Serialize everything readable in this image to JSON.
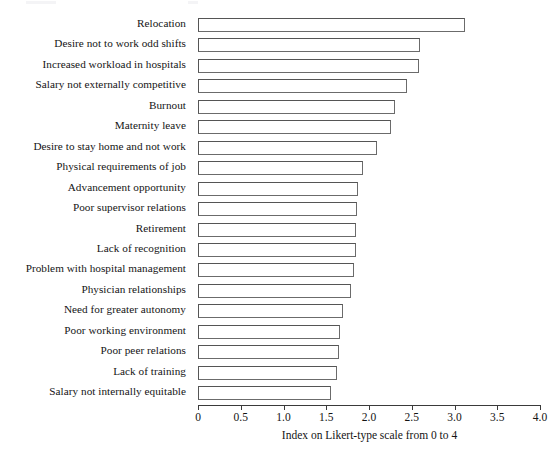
{
  "chart_data": {
    "type": "bar",
    "orientation": "horizontal",
    "title": "",
    "xlabel": "Index on Likert-type scale from 0 to 4",
    "ylabel": "",
    "xlim": [
      0,
      4
    ],
    "grid": false,
    "legend": null,
    "xticks": [
      "0",
      "0.5",
      "1.0",
      "1.5",
      "2.0",
      "2.5",
      "3.0",
      "3.5",
      "4.0"
    ],
    "xtick_values": [
      0,
      0.5,
      1.0,
      1.5,
      2.0,
      2.5,
      3.0,
      3.5,
      4.0
    ],
    "categories": [
      "Relocation",
      "Desire not to work odd shifts",
      "Increased workload in hospitals",
      "Salary not externally competitive",
      "Burnout",
      "Maternity leave",
      "Desire to stay home and not work",
      "Physical requirements of job",
      "Advancement opportunity",
      "Poor supervisor relations",
      "Retirement",
      "Lack of recognition",
      "Problem with hospital management",
      "Physician relationships",
      "Need for greater autonomy",
      "Poor working environment",
      "Poor peer relations",
      "Lack of training",
      "Salary not internally equitable"
    ],
    "values": [
      3.12,
      2.6,
      2.59,
      2.45,
      2.3,
      2.26,
      2.09,
      1.93,
      1.87,
      1.86,
      1.85,
      1.85,
      1.83,
      1.79,
      1.7,
      1.66,
      1.65,
      1.62,
      1.56
    ]
  },
  "axis": {
    "x_title": "Index on Likert-type scale from 0 to 4"
  }
}
